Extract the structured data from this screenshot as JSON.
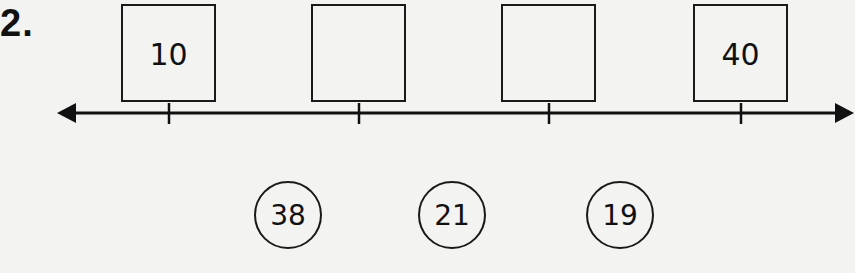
{
  "problem": {
    "number": "2."
  },
  "number_line": {
    "boxes": [
      {
        "value": "10",
        "left": 121
      },
      {
        "value": "",
        "left": 311
      },
      {
        "value": "",
        "left": 501
      },
      {
        "value": "40",
        "left": 693
      }
    ],
    "tick_positions": [
      169,
      359,
      549,
      741
    ]
  },
  "choices": [
    {
      "value": "38"
    },
    {
      "value": "21"
    },
    {
      "value": "19"
    }
  ]
}
